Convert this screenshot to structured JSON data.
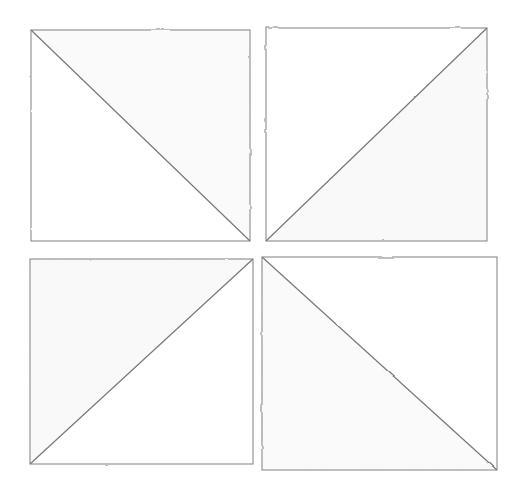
{
  "figure": {
    "canvas": {
      "width": 516,
      "height": 488,
      "background_color": "#ffffff"
    },
    "style": {
      "stroke_color": "#8a8a8a",
      "stroke_color_dark": "#777777",
      "stroke_width": 1.1,
      "shade_fill": "#fbfbfb",
      "shade_fill_alt": "#fafafa",
      "line_quality": "hand-drawn pencil, slightly irregular"
    },
    "layout": {
      "rows": 2,
      "columns": 2,
      "cell_count": 4,
      "gutter_x": 13,
      "gutter_y": 18,
      "symmetry": "4-fold rotational (C4) pinwheel"
    },
    "squares": [
      {
        "id": "square-top-left",
        "name": "Top left square",
        "position": "top-left",
        "x": 31,
        "y": 30,
        "width": 219,
        "height": 211,
        "diagonal": "main",
        "diagonal_from": "top-left",
        "diagonal_to": "bottom-right",
        "shaded_triangle": "upper-right",
        "shade_color": "#fbfbfb"
      },
      {
        "id": "square-top-right",
        "name": "Top right square",
        "position": "top-right",
        "x": 266,
        "y": 28,
        "width": 221,
        "height": 213,
        "diagonal": "anti",
        "diagonal_from": "bottom-left",
        "diagonal_to": "top-right",
        "shaded_triangle": "lower-right",
        "shade_color": "#fafafa"
      },
      {
        "id": "square-bottom-left",
        "name": "Bottom left square",
        "position": "bottom-left",
        "x": 30,
        "y": 259,
        "width": 223,
        "height": 205,
        "diagonal": "anti",
        "diagonal_from": "bottom-left",
        "diagonal_to": "top-right",
        "shaded_triangle": "upper-left",
        "shade_color": "#fafafa"
      },
      {
        "id": "square-bottom-right",
        "name": "Bottom right square",
        "position": "bottom-right",
        "x": 262,
        "y": 257,
        "width": 235,
        "height": 213,
        "diagonal": "main",
        "diagonal_from": "top-left",
        "diagonal_to": "bottom-right",
        "shaded_triangle": "lower-left",
        "shade_color": "#fbfbfb"
      }
    ]
  }
}
